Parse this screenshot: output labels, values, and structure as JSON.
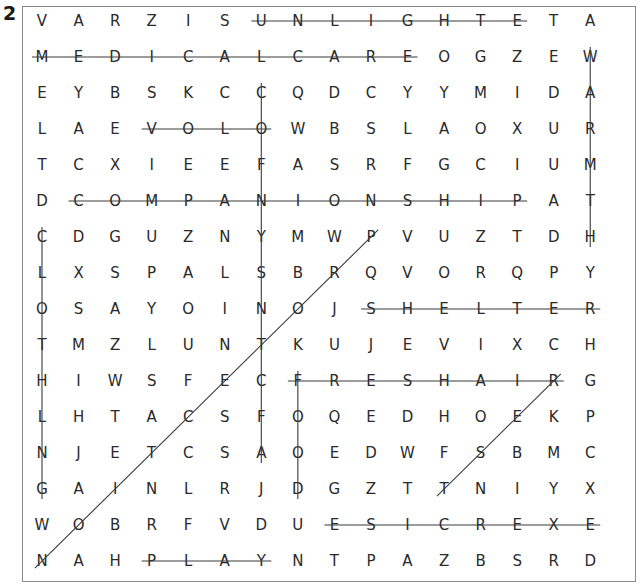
{
  "puzzle": {
    "number": "2",
    "rows": [
      "VARZISUNLIGHTETA",
      "MEDICALCAREOGZEW",
      "EYBSKCCQDCYYMIDA",
      "LAEVOLOWBSLAOXUR",
      "TCXIEEFASRFGCIUM",
      "DCOMPANIONSHIPAT",
      "CDGUZNYMWPVUZTDH",
      "LXSPALSBRQVORQPY",
      "OSAYOINOJSHELTER",
      "TMZLUNTKUJEVIXCH",
      "HIWSFECFRESHAIRG",
      "LHTACSFOQEDHOEKP",
      "NJETCSAOEDWFSBMC",
      "GAINLRJDGZTTNIYX",
      "WOBRFVDUESICREXE",
      "NAHPLAYNTPAZBSRD"
    ],
    "found_words": [
      {
        "word": "SUNLIGHT",
        "start": [
          0,
          6
        ],
        "end": [
          0,
          13
        ]
      },
      {
        "word": "MEDICALCARE",
        "start": [
          1,
          0
        ],
        "end": [
          1,
          10
        ]
      },
      {
        "word": "LOVE",
        "start": [
          3,
          6
        ],
        "end": [
          3,
          3
        ]
      },
      {
        "word": "COMPANIONSHIP",
        "start": [
          5,
          1
        ],
        "end": [
          5,
          13
        ]
      },
      {
        "word": "CLEANLINESS",
        "start": [
          2,
          6
        ],
        "end": [
          12,
          6
        ]
      },
      {
        "word": "CLOTHING",
        "start": [
          6,
          0
        ],
        "end": [
          13,
          0
        ]
      },
      {
        "word": "WARMTH",
        "start": [
          1,
          15
        ],
        "end": [
          6,
          15
        ]
      },
      {
        "word": "SHELTER",
        "start": [
          8,
          9
        ],
        "end": [
          8,
          15
        ]
      },
      {
        "word": "FRESHAIR",
        "start": [
          10,
          7
        ],
        "end": [
          10,
          14
        ]
      },
      {
        "word": "FOOD",
        "start": [
          10,
          7
        ],
        "end": [
          13,
          7
        ]
      },
      {
        "word": "EXERCISE",
        "start": [
          14,
          15
        ],
        "end": [
          14,
          8
        ]
      },
      {
        "word": "PLAY",
        "start": [
          15,
          3
        ],
        "end": [
          15,
          6
        ]
      },
      {
        "word": "PROTECTION",
        "start": [
          6,
          9
        ],
        "end": [
          15,
          0
        ]
      },
      {
        "word": "REST",
        "start": [
          10,
          14
        ],
        "end": [
          13,
          11
        ]
      }
    ]
  },
  "colors": {
    "text": "#2a2a2a",
    "line": "#3a3a3a",
    "frame": "#8a8a8a"
  }
}
